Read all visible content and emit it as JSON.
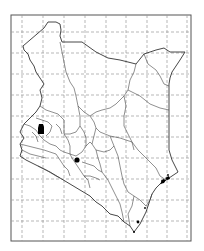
{
  "map": {
    "region": "Kenya",
    "description": "Outline map of Kenya with county boundaries and dashed lat/long grid",
    "frame": {
      "x": 11,
      "y": 15,
      "width": 180,
      "height": 226,
      "stroke": "#555555"
    },
    "grid": {
      "style": "dashed",
      "color": "#9a9a9a",
      "vertical_x": [
        22,
        43,
        64,
        85,
        106,
        126,
        147,
        167,
        187
      ],
      "horizontal_y": [
        32,
        53,
        74,
        95,
        116,
        137,
        158,
        179,
        200,
        221
      ]
    },
    "outline_color": "#333333",
    "markers": [
      {
        "name": "western-site",
        "shape": "blob",
        "x": 41,
        "y": 129,
        "color": "#000000"
      },
      {
        "name": "central-site",
        "shape": "dot",
        "x": 77,
        "y": 160,
        "r": 2.6,
        "color": "#000000"
      },
      {
        "name": "coast-lamu",
        "shape": "cluster",
        "x": 163,
        "y": 180,
        "color": "#000000"
      },
      {
        "name": "coast-south",
        "shape": "cluster",
        "x": 138,
        "y": 222,
        "color": "#000000"
      }
    ]
  }
}
